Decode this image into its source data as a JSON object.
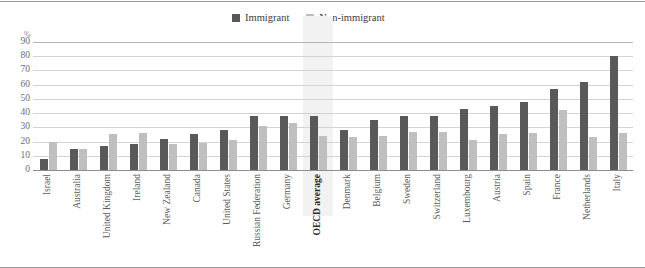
{
  "legend": {
    "items": [
      {
        "label": "Immigrant",
        "color": "#595959",
        "key": "immigrant"
      },
      {
        "label": "Non-immigrant",
        "color": "#bfbfbf",
        "key": "nonimmigrant"
      }
    ]
  },
  "axis": {
    "unit_label": "%",
    "yticks": [
      "90",
      "80",
      "70",
      "60",
      "50",
      "40",
      "30",
      "20",
      "10",
      "0"
    ]
  },
  "chart_data": {
    "type": "bar",
    "title": "",
    "xlabel": "",
    "ylabel": "%",
    "ylim": [
      0,
      90
    ],
    "ytick_step": 10,
    "grid": true,
    "legend_position": "top-center",
    "highlight_category": "OECD average",
    "categories": [
      "Israel",
      "Australia",
      "United Kingdom",
      "Ireland",
      "New Zealand",
      "Canada",
      "United States",
      "Russian Federation",
      "Germany",
      "OECD average",
      "Denmark",
      "Belgium",
      "Sweden",
      "Switzerland",
      "Luxembourg",
      "Austria",
      "Spain",
      "France",
      "Netherlands",
      "Italy"
    ],
    "series": [
      {
        "name": "Immigrant",
        "color": "#595959",
        "values": [
          8,
          15,
          17,
          18,
          22,
          25,
          28,
          38,
          38,
          38,
          28,
          35,
          38,
          38,
          43,
          45,
          48,
          57,
          62,
          80
        ]
      },
      {
        "name": "Non-immigrant",
        "color": "#bfbfbf",
        "values": [
          20,
          15,
          25,
          26,
          18,
          19,
          21,
          31,
          33,
          24,
          23,
          24,
          27,
          27,
          21,
          25,
          26,
          42,
          23,
          26
        ]
      }
    ]
  }
}
